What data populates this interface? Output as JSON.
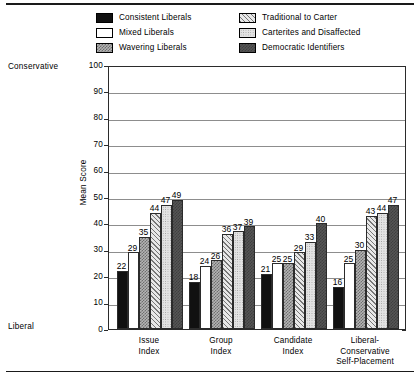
{
  "chart_data": {
    "type": "bar",
    "title": "",
    "subtitle": "",
    "xlabel": "",
    "ylabel": "Mean Score",
    "ylim": [
      0,
      100
    ],
    "ytick_values": [
      0,
      10,
      20,
      30,
      40,
      50,
      60,
      70,
      80,
      90,
      100
    ],
    "grid": true,
    "legend_position": "top",
    "axis_top_annotation": "Conservative",
    "axis_bottom_annotation": "Liberal",
    "categories": [
      "Issue\nIndex",
      "Group\nIndex",
      "Candidate\nIndex",
      "Liberal-\nConservative\nSelf-Placement"
    ],
    "category_lines": [
      [
        "Issue",
        "Index"
      ],
      [
        "Group",
        "Index"
      ],
      [
        "Candidate",
        "Index"
      ],
      [
        "Liberal-",
        "Conservative",
        "Self-Placement"
      ]
    ],
    "series": [
      {
        "name": "Consistent Liberals",
        "pattern": "solid-black",
        "values": [
          22,
          18,
          21,
          16
        ]
      },
      {
        "name": "Mixed Liberals",
        "pattern": "white",
        "values": [
          29,
          24,
          25,
          25
        ]
      },
      {
        "name": "Wavering Liberals",
        "pattern": "checker",
        "values": [
          35,
          26,
          25,
          30
        ]
      },
      {
        "name": "Traditional to Carter",
        "pattern": "hatch",
        "values": [
          44,
          36,
          29,
          43
        ]
      },
      {
        "name": "Carterites and Disaffected",
        "pattern": "dots",
        "values": [
          47,
          37,
          33,
          44
        ]
      },
      {
        "name": "Democratic Identifiers",
        "pattern": "dark-gray",
        "values": [
          49,
          39,
          40,
          47
        ]
      }
    ]
  },
  "legend": {
    "items": [
      {
        "label": "Consistent Liberals",
        "swatch": "solid-black"
      },
      {
        "label": "Traditional to Carter",
        "swatch": "hatch"
      },
      {
        "label": "Mixed Liberals",
        "swatch": "white"
      },
      {
        "label": "Carterites and Disaffected",
        "swatch": "dots"
      },
      {
        "label": "Wavering Liberals",
        "swatch": "checker"
      },
      {
        "label": "Democratic Identifiers",
        "swatch": "dark-gray"
      }
    ]
  },
  "colors": {
    "axis": "#2b2b2b",
    "gridline": "#8d8d8d",
    "background": "#ffffff",
    "text": "#000000"
  }
}
